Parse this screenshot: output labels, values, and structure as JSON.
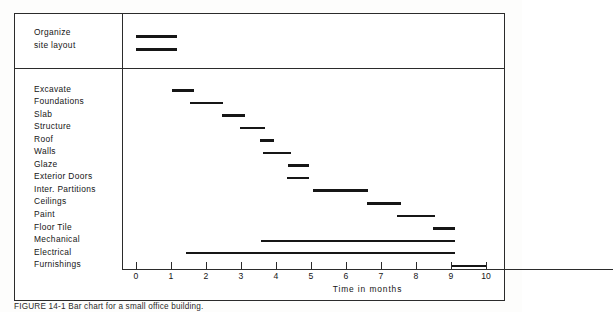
{
  "figure": {
    "caption": "FIGURE 14-1  Bar chart for a small office building.",
    "axis": {
      "title": "Time in months",
      "ticks": [
        0,
        1,
        2,
        3,
        4,
        5,
        6,
        7,
        8,
        9,
        10
      ],
      "tick_labels": [
        "0",
        "1",
        "2",
        "3",
        "4",
        "5",
        "6",
        "7",
        "8",
        "9",
        "10"
      ],
      "min": 0,
      "max": 10.8,
      "unit": "months"
    },
    "header_section": {
      "label_lines": [
        "Organize",
        "site layout"
      ]
    }
  },
  "chart_data": {
    "type": "bar",
    "orientation": "horizontal",
    "subtype": "gantt",
    "title": "",
    "xlabel": "Time in months",
    "ylabel": "",
    "xlim": [
      0,
      10.8
    ],
    "grid": false,
    "legend": null,
    "bar_color": "#161616",
    "header_tasks": [
      {
        "label": "Organize",
        "start": 0.0,
        "end": 1.17,
        "duration": 1.17
      },
      {
        "label": "site layout",
        "start": 0.0,
        "end": 1.17,
        "duration": 1.17
      }
    ],
    "categories": [
      "Excavate",
      "Foundations",
      "Slab",
      "Structure",
      "Roof",
      "Walls",
      "Glaze",
      "Exterior Doors",
      "Inter. Partitions",
      "Ceilings",
      "Paint",
      "Floor Tile",
      "Mechanical",
      "Electrical",
      "Furnishings"
    ],
    "tasks": [
      {
        "label": "Excavate",
        "start": 1.03,
        "end": 1.66,
        "duration": 0.63
      },
      {
        "label": "Foundations",
        "start": 1.54,
        "end": 2.49,
        "duration": 0.95
      },
      {
        "label": "Slab",
        "start": 2.46,
        "end": 3.11,
        "duration": 0.65
      },
      {
        "label": "Structure",
        "start": 2.97,
        "end": 3.69,
        "duration": 0.72
      },
      {
        "label": "Roof",
        "start": 3.54,
        "end": 3.94,
        "duration": 0.4
      },
      {
        "label": "Walls",
        "start": 3.63,
        "end": 4.43,
        "duration": 0.8
      },
      {
        "label": "Glaze",
        "start": 4.34,
        "end": 4.94,
        "duration": 0.6
      },
      {
        "label": "Exterior Doors",
        "start": 4.31,
        "end": 4.94,
        "duration": 0.63
      },
      {
        "label": "Inter. Partitions",
        "start": 5.06,
        "end": 6.63,
        "duration": 1.57
      },
      {
        "label": "Ceilings",
        "start": 6.6,
        "end": 7.57,
        "duration": 0.97
      },
      {
        "label": "Paint",
        "start": 7.46,
        "end": 8.54,
        "duration": 1.08
      },
      {
        "label": "Floor Tile",
        "start": 8.49,
        "end": 9.11,
        "duration": 0.62
      },
      {
        "label": "Mechanical",
        "start": 3.57,
        "end": 9.11,
        "duration": 5.54
      },
      {
        "label": "Electrical",
        "start": 1.43,
        "end": 9.11,
        "duration": 7.68
      },
      {
        "label": "Furnishings",
        "start": 9.03,
        "end": 10.03,
        "duration": 1.0
      }
    ]
  }
}
